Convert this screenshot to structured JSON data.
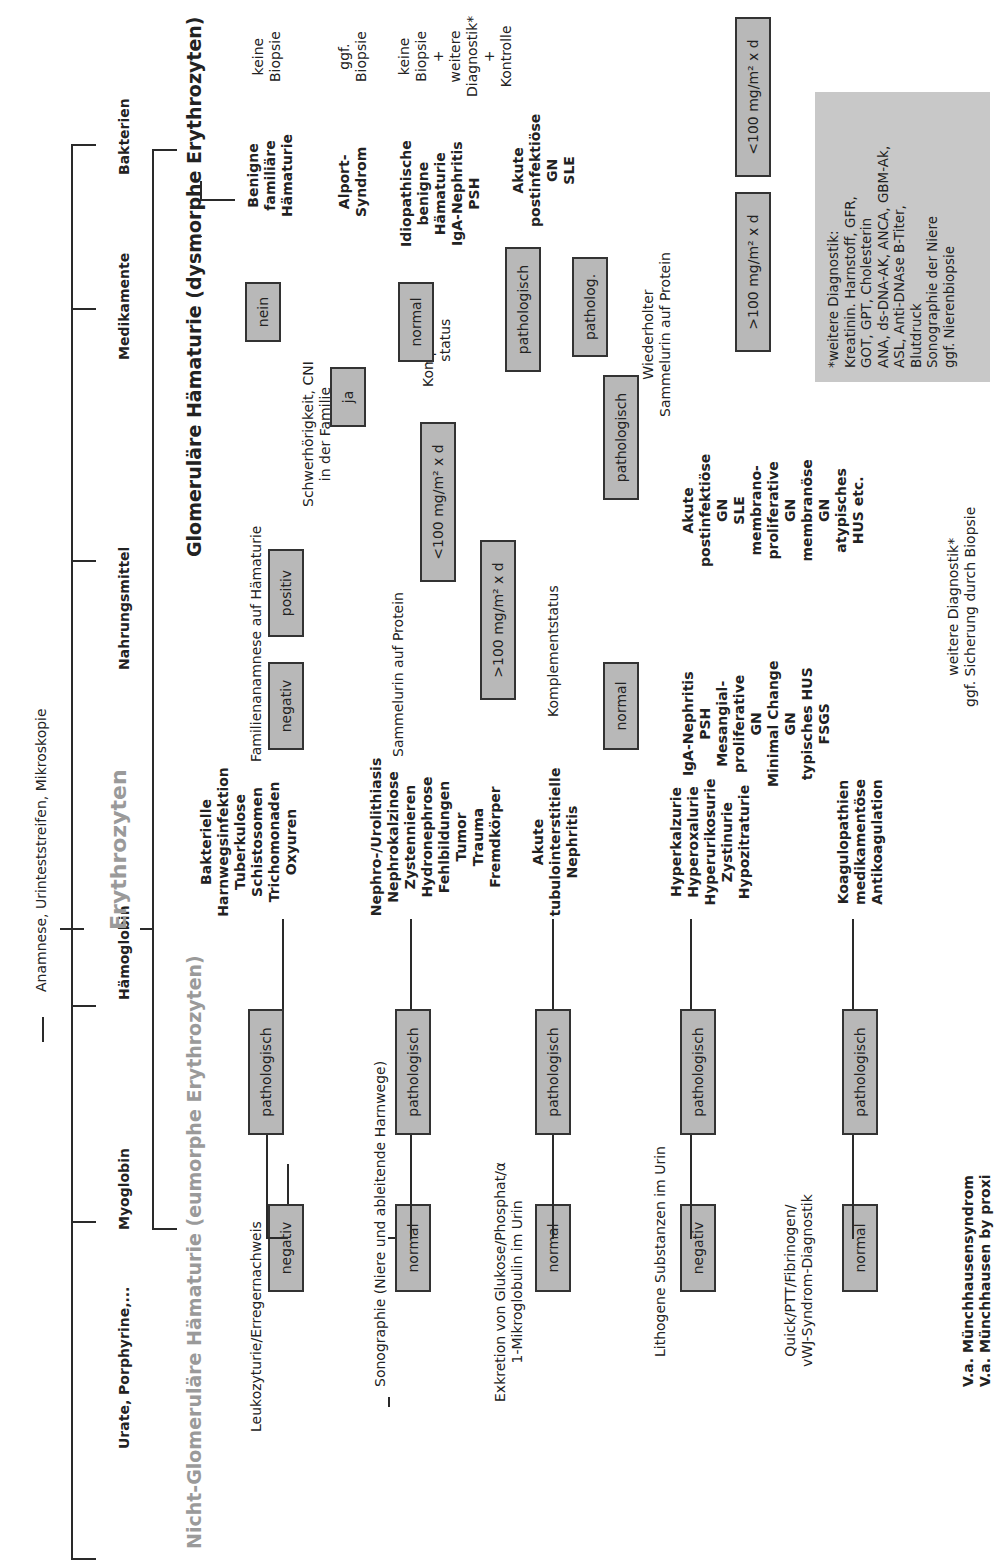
{
  "root": {
    "label": "Anamnese, Urinteststreifen, Mikroskopie"
  },
  "categories": [
    {
      "label": "Urate, Porphyrine,..."
    },
    {
      "label": "Myoglobin"
    },
    {
      "label": "Hämoglobin"
    },
    {
      "label": "Erythrozyten"
    },
    {
      "label": "Nahrungsmittel"
    },
    {
      "label": "Medikamente"
    },
    {
      "label": "Bakterien"
    }
  ],
  "non_glomerular": {
    "title": "Nicht-Glomeruläre Hämaturie (eumorphe Erythrozyten)",
    "steps": [
      {
        "label": "Leukozyturie/Erregernachweis",
        "normal": "negativ",
        "abnormal": "pathologisch",
        "findings": [
          "Bakterielle",
          "Harnwegsinfektion",
          "Tuberkulose",
          "Schistosomen",
          "Trichomonaden",
          "Oxyuren"
        ]
      },
      {
        "label": "Sonographie (Niere und ableitende Harnwege)",
        "normal": "normal",
        "abnormal": "pathologisch",
        "findings": [
          "Nephro-/Urolithiasis",
          "Nephrokalzinose",
          "Zystennieren",
          "Hydronephrose",
          "Fehlbildungen",
          "Tumor",
          "Trauma",
          "Fremdkörper"
        ]
      },
      {
        "label_lines": [
          "Exkretion von Glukose/Phosphat/α",
          "1-Mikroglobulin im Urin"
        ],
        "normal": "normal",
        "abnormal": "pathologisch",
        "findings": [
          "Akute",
          "tubulointerstitielle",
          "Nephritis"
        ]
      },
      {
        "label": "Lithogene Substanzen im Urin",
        "normal": "negativ",
        "abnormal": "pathologisch",
        "findings": [
          "Hyperkalzurie",
          "Hyperoxalurie",
          "Hyperurikosurie",
          "Zystinurie",
          "Hypozitraturie"
        ]
      },
      {
        "label_lines": [
          "Quick/PTT/Fibrinogen/",
          "vWJ-Syndrom-Diagnostik"
        ],
        "normal": "normal",
        "abnormal": "pathologisch",
        "findings": [
          "Koagulopathien",
          "medikamentöse",
          "Antikoagulation"
        ]
      }
    ],
    "final": [
      "V.a. Münchhausensyndrom",
      "V.a. Münchhausen by proxi"
    ]
  },
  "glomerular": {
    "title": "Glomeruläre Hämaturie (dysmorphe Erythrozyten)",
    "family": {
      "label": "Familienanamnese auf Hämaturie",
      "negative": "negativ",
      "positive": "positiv",
      "question_lines": [
        "Schwerhörigkeit, CNI",
        "in der Familie"
      ],
      "no": "nein",
      "yes": "ja",
      "no_result": [
        "Benigne",
        "familiäre",
        "Hämaturie"
      ],
      "no_action": [
        "keine",
        "Biopsie"
      ],
      "yes_result": [
        "Alport-",
        "Syndrom"
      ],
      "yes_action": [
        "ggf.",
        "Biopsie"
      ]
    },
    "protein": {
      "label": "Sammelurin auf Protein",
      "high": ">100 mg/m² x d",
      "low": "<100 mg/m² x d",
      "complement_lines": [
        "Komplement-",
        "status"
      ],
      "normal": "normal",
      "pathological": "pathologisch",
      "normal_result": [
        "Idiopathische",
        "benigne",
        "Hämaturie",
        "IgA-Nephritis",
        "PSH"
      ],
      "normal_action": [
        "keine",
        "Biopsie",
        "+",
        "weitere",
        "Diagnostik*",
        "+",
        "Kontrolle"
      ],
      "path_result": [
        "Akute",
        "postinfektiöse",
        "GN",
        "SLE"
      ],
      "patholog": "patholog.",
      "repeat_lines": [
        "Wiederholter",
        "Sammelurin auf Protein"
      ],
      "repeat_high": ">100 mg/m² x d",
      "repeat_low": "<100 mg/m² x d"
    },
    "complement": {
      "label": "Komplementstatus",
      "normal": "normal",
      "pathological": "pathologisch",
      "normal_result": [
        "IgA-Nephritis",
        "PSH",
        "Mesangial-",
        "proliferative",
        "GN",
        "Minimal Change",
        "GN",
        "typisches HUS",
        "FSGS"
      ],
      "path_result": [
        "Akute",
        "postinfektiöse",
        "GN",
        "SLE",
        "membrano-",
        "proliferative",
        "GN",
        "membranöse",
        "GN",
        "atypisches",
        "HUS etc."
      ],
      "action_lines": [
        "weitere Diagnostik*",
        "ggf. Sicherung durch Biopsie"
      ]
    }
  },
  "footnote": {
    "text": "*weitere Diagnostik:\nKreatinin. Harnstoff, GFR,\nGOT, GPT, Cholesterin\nANA, ds-DNA-AK, ANCA, GBM-Ak,\nASL, Anti-DNAse B-Titer,\nBlutdruck\nSonographie der Niere\nggf. Nierenbiopsie"
  },
  "colors": {
    "box_fill": "#b8b8b8",
    "heading_gray": "#9a9a9a",
    "line": "#2a2a2a",
    "note_fill": "#c8c8c8"
  }
}
